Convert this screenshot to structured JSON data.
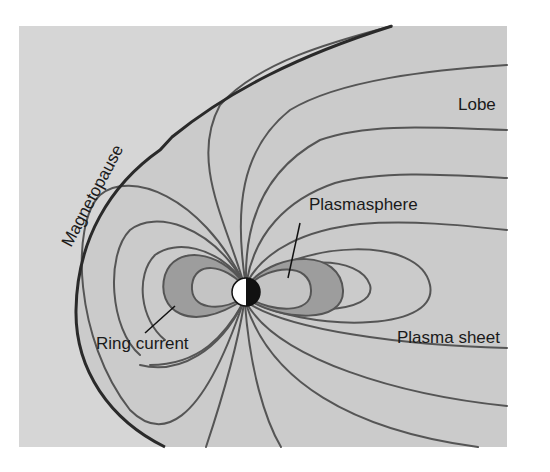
{
  "diagram": {
    "labels": {
      "magnetopause": "Magnetopause",
      "lobe": "Lobe",
      "plasmasphere": "Plasmasphere",
      "ring_current": "Ring current",
      "plasma_sheet": "Plasma sheet"
    },
    "colors": {
      "background": "#d6d6d6",
      "magnetosphere_fill": "#cbcbcb",
      "ring_current_fill": "#9d9d9d",
      "plasmasphere_fill": "#c4c4c4",
      "field_line": "#555555",
      "magnetopause_line": "#2a2a2a",
      "earth_day": "#ffffff",
      "earth_night": "#111111"
    }
  }
}
